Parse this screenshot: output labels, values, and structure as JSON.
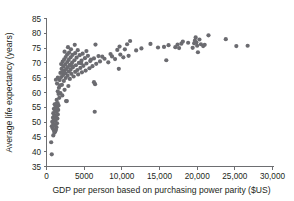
{
  "chart_data": {
    "type": "scatter",
    "title": "",
    "xlabel": "GDP per person based on purchasing power parity ($US)",
    "ylabel": "Average life expectancy (years)",
    "xlim": [
      0,
      30000
    ],
    "ylim": [
      35,
      85
    ],
    "xticks": [
      0,
      5000,
      10000,
      15000,
      20000,
      25000,
      30000
    ],
    "xtick_labels": [
      "0",
      "5000",
      "10,000",
      "15,000",
      "20,000",
      "25,000",
      "30,000"
    ],
    "yticks": [
      35,
      40,
      45,
      50,
      55,
      60,
      65,
      70,
      75,
      80,
      85
    ],
    "ytick_labels": [
      "35",
      "40",
      "45",
      "50",
      "55",
      "60",
      "65",
      "70",
      "75",
      "80",
      "85"
    ],
    "grid": false,
    "legend": null,
    "marker_color": "#6b6b70",
    "marker_size": 2.1,
    "axis_color": "#6d6e71",
    "series": [
      {
        "name": "Countries",
        "points": [
          [
            700,
            39.1
          ],
          [
            620,
            43.2
          ],
          [
            900,
            45.5
          ],
          [
            1050,
            46.4
          ],
          [
            1150,
            46.8
          ],
          [
            980,
            47.2
          ],
          [
            1250,
            47.4
          ],
          [
            820,
            47.9
          ],
          [
            1320,
            48.3
          ],
          [
            700,
            48.6
          ],
          [
            1100,
            49.0
          ],
          [
            900,
            49.4
          ],
          [
            1400,
            49.6
          ],
          [
            760,
            50.1
          ],
          [
            1180,
            50.4
          ],
          [
            980,
            50.8
          ],
          [
            1450,
            51.2
          ],
          [
            860,
            51.5
          ],
          [
            1250,
            51.9
          ],
          [
            1050,
            52.3
          ],
          [
            1500,
            52.6
          ],
          [
            900,
            53.0
          ],
          [
            1320,
            53.4
          ],
          [
            1150,
            53.8
          ],
          [
            1550,
            54.1
          ],
          [
            980,
            54.5
          ],
          [
            1400,
            54.9
          ],
          [
            1220,
            55.3
          ],
          [
            1600,
            55.6
          ],
          [
            1080,
            56.0
          ],
          [
            1480,
            56.4
          ],
          [
            2700,
            57.1
          ],
          [
            1350,
            57.5
          ],
          [
            1700,
            58.2
          ],
          [
            2100,
            59.0
          ],
          [
            1850,
            59.8
          ],
          [
            1500,
            60.4
          ],
          [
            2400,
            60.9
          ],
          [
            1650,
            61.6
          ],
          [
            2900,
            62.2
          ],
          [
            2050,
            62.6
          ],
          [
            1400,
            63.0
          ],
          [
            6450,
            62.8
          ],
          [
            6300,
            63.5
          ],
          [
            2300,
            63.9
          ],
          [
            1750,
            64.2
          ],
          [
            3100,
            64.6
          ],
          [
            2550,
            64.9
          ],
          [
            1950,
            65.2
          ],
          [
            3600,
            65.4
          ],
          [
            2800,
            65.7
          ],
          [
            2200,
            65.9
          ],
          [
            4200,
            66.1
          ],
          [
            3300,
            66.3
          ],
          [
            2500,
            66.5
          ],
          [
            1850,
            66.6
          ],
          [
            4700,
            66.8
          ],
          [
            3800,
            67.0
          ],
          [
            2950,
            67.1
          ],
          [
            2350,
            67.3
          ],
          [
            5200,
            67.4
          ],
          [
            4100,
            67.6
          ],
          [
            3200,
            67.7
          ],
          [
            2600,
            67.9
          ],
          [
            2000,
            68.0
          ],
          [
            5700,
            68.2
          ],
          [
            4500,
            68.3
          ],
          [
            3500,
            68.5
          ],
          [
            2850,
            68.6
          ],
          [
            2250,
            68.8
          ],
          [
            9600,
            68.0
          ],
          [
            6100,
            68.9
          ],
          [
            4900,
            69.0
          ],
          [
            3900,
            69.2
          ],
          [
            3100,
            69.3
          ],
          [
            2500,
            69.5
          ],
          [
            1950,
            69.6
          ],
          [
            6600,
            69.7
          ],
          [
            5300,
            69.8
          ],
          [
            4300,
            70.0
          ],
          [
            3400,
            70.1
          ],
          [
            2750,
            70.3
          ],
          [
            2150,
            70.4
          ],
          [
            8200,
            70.2
          ],
          [
            7100,
            70.5
          ],
          [
            5800,
            70.6
          ],
          [
            4650,
            70.8
          ],
          [
            3700,
            70.9
          ],
          [
            2950,
            71.0
          ],
          [
            2350,
            71.2
          ],
          [
            9100,
            71.3
          ],
          [
            7700,
            71.4
          ],
          [
            6300,
            71.5
          ],
          [
            5100,
            71.6
          ],
          [
            4000,
            71.8
          ],
          [
            3200,
            71.9
          ],
          [
            2550,
            72.0
          ],
          [
            10200,
            71.9
          ],
          [
            8700,
            72.2
          ],
          [
            6900,
            72.3
          ],
          [
            5500,
            72.4
          ],
          [
            4400,
            72.6
          ],
          [
            3450,
            72.7
          ],
          [
            2750,
            72.9
          ],
          [
            10900,
            72.4
          ],
          [
            9800,
            72.8
          ],
          [
            4800,
            73.1
          ],
          [
            3800,
            73.3
          ],
          [
            3000,
            73.5
          ],
          [
            2400,
            73.8
          ],
          [
            11900,
            74.2
          ],
          [
            10400,
            74.6
          ],
          [
            9400,
            74.4
          ],
          [
            5300,
            74.0
          ],
          [
            4150,
            74.3
          ],
          [
            3250,
            74.6
          ],
          [
            13800,
            76.4
          ],
          [
            14800,
            75.2
          ],
          [
            15600,
            75.4
          ],
          [
            15900,
            70.9
          ],
          [
            17100,
            75.3
          ],
          [
            17600,
            75.0
          ],
          [
            17400,
            76.2
          ],
          [
            17900,
            76.5
          ],
          [
            18100,
            77.2
          ],
          [
            19400,
            75.1
          ],
          [
            19600,
            76.6
          ],
          [
            19700,
            77.5
          ],
          [
            19800,
            78.6
          ],
          [
            19900,
            76.9
          ],
          [
            20000,
            75.8
          ],
          [
            20100,
            73.6
          ],
          [
            20300,
            77.9
          ],
          [
            20500,
            76.3
          ],
          [
            20800,
            75.7
          ],
          [
            21500,
            79.3
          ],
          [
            23800,
            78.0
          ],
          [
            25200,
            75.7
          ],
          [
            26700,
            75.8
          ],
          [
            10700,
            76.3
          ],
          [
            11100,
            77.4
          ],
          [
            9700,
            75.5
          ],
          [
            6500,
            76.2
          ],
          [
            3750,
            76.1
          ],
          [
            2850,
            75.3
          ],
          [
            6400,
            53.5
          ],
          [
            2600,
            57.1
          ],
          [
            1800,
            62.4
          ],
          [
            1600,
            59.5
          ],
          [
            1300,
            56.2
          ],
          [
            1200,
            54.7
          ],
          [
            1050,
            51.1
          ],
          [
            950,
            48.8
          ],
          [
            1500,
            65.0
          ],
          [
            1250,
            64.3
          ],
          [
            2100,
            66.9
          ],
          [
            3400,
            68.9
          ],
          [
            4600,
            69.9
          ],
          [
            5900,
            71.1
          ],
          [
            7400,
            72.1
          ],
          [
            8500,
            73.0
          ],
          [
            12600,
            74.9
          ],
          [
            16200,
            76.0
          ],
          [
            18800,
            76.8
          ],
          [
            21000,
            76.1
          ]
        ]
      }
    ]
  }
}
